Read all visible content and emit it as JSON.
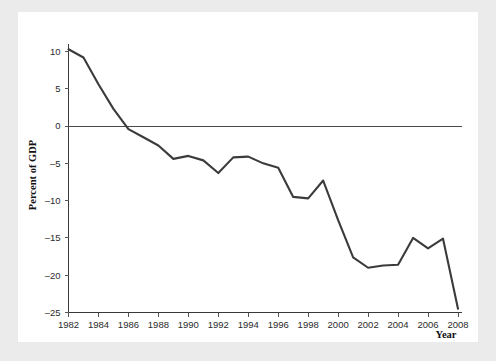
{
  "chart_data": {
    "type": "line",
    "title": "",
    "subtitle": "",
    "xlabel": "Year",
    "ylabel": "Percent of GDP",
    "xlim": [
      1982,
      2008
    ],
    "ylim": [
      -25,
      10
    ],
    "xticks": [
      1982,
      1984,
      1986,
      1988,
      1990,
      1992,
      1994,
      1996,
      1998,
      2000,
      2002,
      2004,
      2006,
      2008
    ],
    "xtick_labels": [
      "1982",
      "1984",
      "1986",
      "1988",
      "1990",
      "1992",
      "1994",
      "1996",
      "1998",
      "2000",
      "2002",
      "2004",
      "2006",
      "2008"
    ],
    "yticks": [
      10,
      5,
      0,
      -5,
      -10,
      -15,
      -20,
      -25
    ],
    "ytick_labels": [
      "10",
      "5",
      "0",
      "-5",
      "-10",
      "-15",
      "-20",
      "-25"
    ],
    "grid": false,
    "legend": false,
    "legend_position": "none",
    "zero_line": true,
    "x": [
      1982,
      1983,
      1984,
      1985,
      1986,
      1987,
      1988,
      1989,
      1990,
      1991,
      1992,
      1993,
      1994,
      1995,
      1996,
      1997,
      1998,
      1999,
      2000,
      2001,
      2002,
      2003,
      2004,
      2005,
      2006,
      2007,
      2008
    ],
    "values": [
      10.3,
      9.2,
      5.6,
      2.3,
      -0.4,
      -1.5,
      -2.6,
      -4.4,
      -4.0,
      -4.6,
      -6.3,
      -4.2,
      -4.1,
      -5.0,
      -5.6,
      -9.5,
      -9.7,
      -7.3,
      -12.6,
      -17.6,
      -19.0,
      -18.7,
      -18.6,
      -15.0,
      -16.4,
      -15.1,
      -24.5
    ],
    "series": [
      {
        "name": "Percent of GDP",
        "color": "#3b3b3b",
        "values": [
          10.3,
          9.2,
          5.6,
          2.3,
          -0.4,
          -1.5,
          -2.6,
          -4.4,
          -4.0,
          -4.6,
          -6.3,
          -4.2,
          -4.1,
          -5.0,
          -5.6,
          -9.5,
          -9.7,
          -7.3,
          -12.6,
          -17.6,
          -19.0,
          -18.7,
          -18.6,
          -15.0,
          -16.4,
          -15.1,
          -24.5
        ]
      }
    ]
  },
  "figure": {
    "background_color": "#ebebeb",
    "plot_background_color": "#ffffff",
    "line_color": "#3b3b3b",
    "axis_color": "#3a3a3a"
  }
}
